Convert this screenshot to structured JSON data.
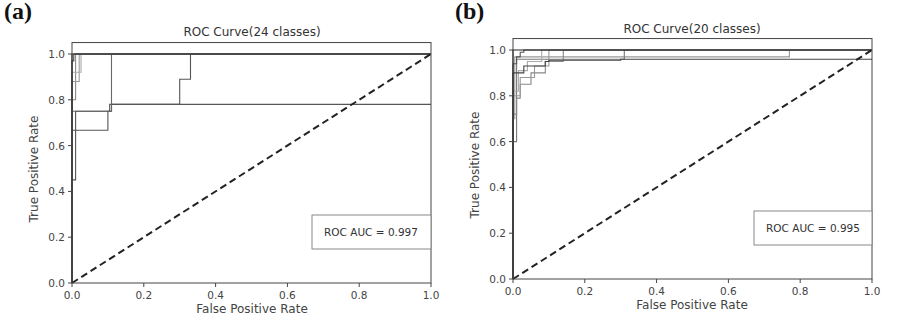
{
  "panels": [
    {
      "label": "(a)"
    },
    {
      "label": "(b)"
    }
  ],
  "chart_data": [
    {
      "type": "line",
      "panel": "(a)",
      "title": "ROC Curve(24 classes)",
      "xlabel": "False Positive Rate",
      "ylabel": "True Positive Rate",
      "xlim": [
        0.0,
        1.0
      ],
      "ylim": [
        0.0,
        1.05
      ],
      "xticks": [
        "0.0",
        "0.2",
        "0.4",
        "0.6",
        "0.8",
        "1.0"
      ],
      "yticks": [
        "0.0",
        "0.2",
        "0.4",
        "0.6",
        "0.8",
        "1.0"
      ],
      "grid": false,
      "legend": {
        "text": "ROC AUC = 0.997",
        "position": "lower right"
      },
      "chance_line": {
        "x": [
          0,
          1
        ],
        "y": [
          0,
          1
        ],
        "style": "dashed"
      },
      "series": [
        {
          "name": "class-a1",
          "x": [
            0,
            0,
            0.1,
            0.1,
            0.105,
            0.105,
            1.0
          ],
          "y": [
            0,
            0.667,
            0.667,
            0.75,
            0.75,
            0.78,
            0.78
          ],
          "shade": "#555"
        },
        {
          "name": "class-a2",
          "x": [
            0,
            0,
            0.01,
            0.01,
            0.11,
            0.11,
            0.3,
            0.3,
            0.33,
            0.33,
            1.0
          ],
          "y": [
            0,
            0.45,
            0.45,
            0.75,
            0.75,
            0.78,
            0.78,
            0.89,
            0.89,
            1.0,
            1.0
          ],
          "shade": "#555"
        },
        {
          "name": "class-a3",
          "x": [
            0,
            0,
            0.11,
            0.11,
            1.0
          ],
          "y": [
            0,
            0.75,
            0.75,
            1.0,
            1.0
          ],
          "shade": "#666"
        },
        {
          "name": "class-a4",
          "x": [
            0,
            0,
            0.01,
            0.01,
            1.0
          ],
          "y": [
            0,
            0.8,
            0.8,
            1.0,
            1.0
          ],
          "shade": "#888"
        },
        {
          "name": "class-a5",
          "x": [
            0,
            0,
            0.02,
            0.02,
            1.0
          ],
          "y": [
            0,
            0.88,
            0.88,
            1.0,
            1.0
          ],
          "shade": "#999"
        },
        {
          "name": "class-a6",
          "x": [
            0,
            0,
            0.025,
            0.025,
            1.0
          ],
          "y": [
            0,
            0.92,
            0.92,
            1.0,
            1.0
          ],
          "shade": "#aaa"
        },
        {
          "name": "class-a7",
          "x": [
            0,
            0,
            0.005,
            0.005,
            1.0
          ],
          "y": [
            0,
            0.97,
            0.97,
            1.0,
            1.0
          ],
          "shade": "#444"
        },
        {
          "name": "class-a-rest",
          "x": [
            0,
            0,
            1.0
          ],
          "y": [
            0,
            1.0,
            1.0
          ],
          "shade": "#222"
        }
      ]
    },
    {
      "type": "line",
      "panel": "(b)",
      "title": "ROC Curve(20 classes)",
      "xlabel": "False Positive Rate",
      "ylabel": "True Positive Rate",
      "xlim": [
        0.0,
        1.0
      ],
      "ylim": [
        0.0,
        1.05
      ],
      "xticks": [
        "0.0",
        "0.2",
        "0.4",
        "0.6",
        "0.8",
        "1.0"
      ],
      "yticks": [
        "0.0",
        "0.2",
        "0.4",
        "0.6",
        "0.8",
        "1.0"
      ],
      "grid": false,
      "legend": {
        "text": "ROC AUC = 0.995",
        "position": "lower right"
      },
      "chance_line": {
        "x": [
          0,
          1
        ],
        "y": [
          0,
          1
        ],
        "style": "dashed"
      },
      "series": [
        {
          "name": "class-b1",
          "x": [
            0,
            0,
            0.005,
            0.005,
            0.77,
            0.77,
            1.0
          ],
          "y": [
            0,
            0.7,
            0.7,
            0.97,
            0.97,
            1.0,
            1.0
          ],
          "shade": "#999"
        },
        {
          "name": "class-b2",
          "x": [
            0,
            0,
            0.01,
            0.01,
            0.28,
            0.28,
            0.31,
            0.31,
            1.0
          ],
          "y": [
            0,
            0.6,
            0.6,
            0.96,
            0.96,
            0.96,
            0.96,
            1.0,
            1.0
          ],
          "shade": "#777"
        },
        {
          "name": "class-b3",
          "x": [
            0,
            0,
            0.01,
            0.01,
            0.02,
            0.02,
            0.05,
            0.05,
            0.09,
            0.09,
            0.14,
            0.14,
            1.0
          ],
          "y": [
            0,
            0.72,
            0.72,
            0.79,
            0.79,
            0.85,
            0.85,
            0.9,
            0.9,
            0.95,
            0.95,
            1.0,
            1.0
          ],
          "shade": "#888"
        },
        {
          "name": "class-b4",
          "x": [
            0,
            0,
            0.02,
            0.02,
            0.06,
            0.06,
            0.1,
            0.1,
            1.0
          ],
          "y": [
            0,
            0.8,
            0.8,
            0.88,
            0.88,
            0.93,
            0.93,
            1.0,
            1.0
          ],
          "shade": "#999"
        },
        {
          "name": "class-b5",
          "x": [
            0,
            0,
            0.015,
            0.015,
            0.04,
            0.04,
            0.08,
            0.08,
            1.0
          ],
          "y": [
            0,
            0.82,
            0.82,
            0.91,
            0.91,
            0.95,
            0.95,
            1.0,
            1.0
          ],
          "shade": "#aaa"
        },
        {
          "name": "class-b6",
          "x": [
            0,
            0,
            0.03,
            0.03,
            0.05,
            0.05,
            0.09,
            0.09,
            0.1,
            0.1,
            0.3,
            0.3,
            1.0
          ],
          "y": [
            0,
            0.9,
            0.9,
            0.93,
            0.93,
            0.93,
            0.93,
            0.95,
            0.95,
            0.955,
            0.955,
            0.96,
            0.96
          ],
          "shade": "#444"
        },
        {
          "name": "class-b7",
          "x": [
            0,
            0,
            0.01,
            0.01,
            0.02,
            0.02,
            0.03,
            0.03,
            1.0
          ],
          "y": [
            0,
            0.94,
            0.94,
            0.97,
            0.97,
            0.99,
            0.99,
            1.0,
            1.0
          ],
          "shade": "#555"
        },
        {
          "name": "class-b-rest",
          "x": [
            0,
            0,
            1.0
          ],
          "y": [
            0,
            1.0,
            1.0
          ],
          "shade": "#222"
        }
      ]
    }
  ]
}
